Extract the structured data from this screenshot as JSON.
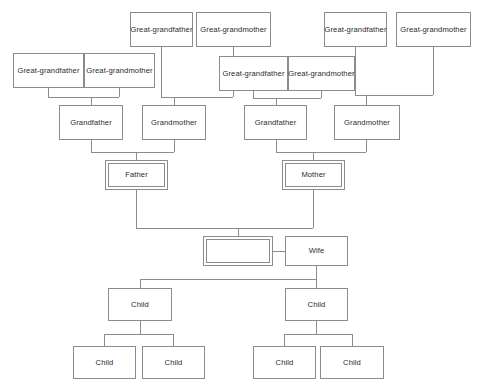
{
  "diagram": {
    "line_color": "#8c8c8c",
    "box_border_color": "#8c8c8c",
    "box_fill_color": "#ffffff",
    "text_color": "#2b2b2b",
    "background_color": "#ffffff"
  },
  "labels": {
    "great_grandfather": "Great-grandfather",
    "great_grandmother": "Great-grandmother",
    "grandfather": "Grandfather",
    "grandmother": "Grandmother",
    "father": "Father",
    "mother": "Mother",
    "self": "",
    "wife": "Wife",
    "child": "Child"
  },
  "generations": [
    {
      "name": "great-grandparents",
      "nodes": [
        {
          "id": "ggf-1",
          "label": "Great-grandfather",
          "x": 13,
          "y": 53,
          "w": 71,
          "h": 35,
          "double": false
        },
        {
          "id": "ggm-1",
          "label": "Great-grandmother",
          "x": 84,
          "y": 53,
          "w": 71,
          "h": 35,
          "double": false
        },
        {
          "id": "ggf-2",
          "label": "Great-grandfather",
          "x": 130,
          "y": 12,
          "w": 63,
          "h": 35,
          "double": false
        },
        {
          "id": "ggm-2",
          "label": "Great-grandmother",
          "x": 196,
          "y": 12,
          "w": 75,
          "h": 35,
          "double": false
        },
        {
          "id": "ggf-3",
          "label": "Great-grandfather",
          "x": 219,
          "y": 56,
          "w": 69,
          "h": 35,
          "double": false
        },
        {
          "id": "ggm-3",
          "label": "Great-grandmother",
          "x": 288,
          "y": 56,
          "w": 67,
          "h": 35,
          "double": false
        },
        {
          "id": "ggf-4",
          "label": "Great-grandfather",
          "x": 324,
          "y": 12,
          "w": 63,
          "h": 35,
          "double": false
        },
        {
          "id": "ggm-4",
          "label": "Great-grandmother",
          "x": 396,
          "y": 12,
          "w": 75,
          "h": 35,
          "double": false
        }
      ]
    },
    {
      "name": "grandparents",
      "nodes": [
        {
          "id": "gf-1",
          "label": "Grandfather",
          "x": 59,
          "y": 105,
          "w": 64,
          "h": 35,
          "double": false
        },
        {
          "id": "gm-1",
          "label": "Grandmother",
          "x": 142,
          "y": 105,
          "w": 64,
          "h": 35,
          "double": false
        },
        {
          "id": "gf-2",
          "label": "Grandfather",
          "x": 244,
          "y": 105,
          "w": 63,
          "h": 35,
          "double": false
        },
        {
          "id": "gm-2",
          "label": "Grandmother",
          "x": 334,
          "y": 105,
          "w": 66,
          "h": 35,
          "double": false
        }
      ]
    },
    {
      "name": "parents",
      "nodes": [
        {
          "id": "father",
          "label": "Father",
          "x": 105,
          "y": 160,
          "w": 63,
          "h": 30,
          "double": true
        },
        {
          "id": "mother",
          "label": "Mother",
          "x": 282,
          "y": 160,
          "w": 63,
          "h": 30,
          "double": true
        }
      ]
    },
    {
      "name": "self-spouse",
      "nodes": [
        {
          "id": "self",
          "label": "",
          "x": 203,
          "y": 236,
          "w": 70,
          "h": 30,
          "double": true
        },
        {
          "id": "wife",
          "label": "Wife",
          "x": 285,
          "y": 236,
          "w": 63,
          "h": 30,
          "double": false
        }
      ]
    },
    {
      "name": "children",
      "nodes": [
        {
          "id": "child-1",
          "label": "Child",
          "x": 108,
          "y": 288,
          "w": 64,
          "h": 33,
          "double": false
        },
        {
          "id": "child-2",
          "label": "Child",
          "x": 285,
          "y": 288,
          "w": 63,
          "h": 33,
          "double": false
        }
      ]
    },
    {
      "name": "grandchildren",
      "nodes": [
        {
          "id": "gc-1",
          "label": "Child",
          "x": 73,
          "y": 346,
          "w": 63,
          "h": 33,
          "double": false
        },
        {
          "id": "gc-2",
          "label": "Child",
          "x": 142,
          "y": 346,
          "w": 63,
          "h": 33,
          "double": false
        },
        {
          "id": "gc-3",
          "label": "Child",
          "x": 253,
          "y": 346,
          "w": 63,
          "h": 33,
          "double": false
        },
        {
          "id": "gc-4",
          "label": "Child",
          "x": 320,
          "y": 346,
          "w": 64,
          "h": 33,
          "double": false
        }
      ]
    }
  ],
  "connectors": [
    {
      "id": "ggp1-pair-left-drop",
      "points": "48,88 48,97"
    },
    {
      "id": "ggp1-pair-right-drop",
      "points": "119,88 119,97"
    },
    {
      "id": "ggp1-pair-bar",
      "points": "48,97 119,97"
    },
    {
      "id": "ggp1-to-gf1",
      "points": "91,97 91,105"
    },
    {
      "id": "ggf2-drop",
      "points": "161,47 161,97"
    },
    {
      "id": "ggm2-drop",
      "points": "233,47 233,97"
    },
    {
      "id": "ggp2-bar",
      "points": "161,97 233,97"
    },
    {
      "id": "ggp2-to-gm1",
      "points": "174,97 174,105"
    },
    {
      "id": "ggp3-pair-left-drop",
      "points": "253,91 253,98"
    },
    {
      "id": "ggp3-pair-right-drop",
      "points": "321,91 321,98"
    },
    {
      "id": "ggp3-pair-bar",
      "points": "253,98 321,98"
    },
    {
      "id": "ggp3-to-gf2",
      "points": "276,98 276,105"
    },
    {
      "id": "ggf4-drop",
      "points": "355,47 355,95"
    },
    {
      "id": "ggm4-drop",
      "points": "433,47 433,95"
    },
    {
      "id": "ggp4-bar",
      "points": "355,95 433,95"
    },
    {
      "id": "ggp4-to-gm2",
      "points": "366,95 366,105"
    },
    {
      "id": "gf1-drop",
      "points": "91,140 91,152"
    },
    {
      "id": "gm1-drop",
      "points": "174,140 174,152"
    },
    {
      "id": "gp1-bar",
      "points": "91,152 174,152"
    },
    {
      "id": "gp1-to-father",
      "points": "136,152 136,160"
    },
    {
      "id": "gf2-drop",
      "points": "276,140 276,152"
    },
    {
      "id": "gm2-drop",
      "points": "366,140 366,152"
    },
    {
      "id": "gp2-bar",
      "points": "276,152 366,152"
    },
    {
      "id": "gp2-to-mother",
      "points": "313,152 313,160"
    },
    {
      "id": "father-drop",
      "points": "136,190 136,228"
    },
    {
      "id": "mother-drop",
      "points": "313,190 313,228"
    },
    {
      "id": "parents-bar",
      "points": "136,228 313,228"
    },
    {
      "id": "parents-to-self",
      "points": "238,228 238,236"
    },
    {
      "id": "self-to-wife",
      "points": "273,251 285,251"
    },
    {
      "id": "wife-drop",
      "points": "316,266 316,279"
    },
    {
      "id": "children-bar",
      "points": "140,279 316,279"
    },
    {
      "id": "bar-to-child1",
      "points": "140,279 140,288"
    },
    {
      "id": "bar-to-child2",
      "points": "316,279 316,288"
    },
    {
      "id": "child1-drop",
      "points": "140,321 140,334"
    },
    {
      "id": "gc-bar-left",
      "points": "104,334 173,334"
    },
    {
      "id": "bar-to-gc1",
      "points": "104,334 104,346"
    },
    {
      "id": "bar-to-gc2",
      "points": "173,334 173,346"
    },
    {
      "id": "child2-drop",
      "points": "316,321 316,334"
    },
    {
      "id": "gc-bar-right",
      "points": "284,334 352,334"
    },
    {
      "id": "bar-to-gc3",
      "points": "284,334 284,346"
    },
    {
      "id": "bar-to-gc4",
      "points": "352,334 352,346"
    }
  ]
}
